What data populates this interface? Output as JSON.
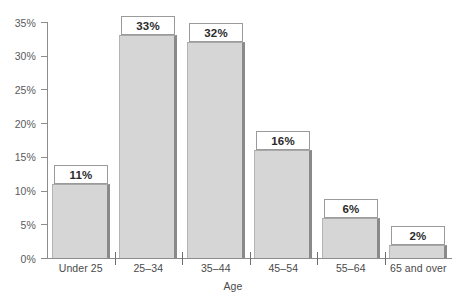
{
  "chart_data": {
    "type": "bar",
    "title": "",
    "subtitle": "",
    "xlabel": "Age",
    "ylabel": "",
    "categories": [
      "Under 25",
      "25–34",
      "35–44",
      "45–54",
      "55–64",
      "65 and over"
    ],
    "values": [
      11,
      33,
      32,
      16,
      6,
      2
    ],
    "data_labels": [
      "11%",
      "33%",
      "32%",
      "16%",
      "6%",
      "2%"
    ],
    "ylim": [
      0,
      35
    ],
    "y_ticks": [
      0,
      5,
      10,
      15,
      20,
      25,
      30,
      35
    ],
    "y_tick_labels": [
      "0%",
      "5%",
      "10%",
      "15%",
      "20%",
      "25%",
      "30%",
      "35%"
    ],
    "grid": false,
    "legend": false,
    "legend_position": "none",
    "colors": {
      "bar_fill": "#d6d6d6",
      "bar_shadow": "#8a8a8a",
      "bar_outline": "#a8a8a8",
      "axis": "#8c8c8c",
      "label_text": "#4a4a4a",
      "value_text": "#2b2b2b",
      "background": "#ffffff"
    }
  }
}
